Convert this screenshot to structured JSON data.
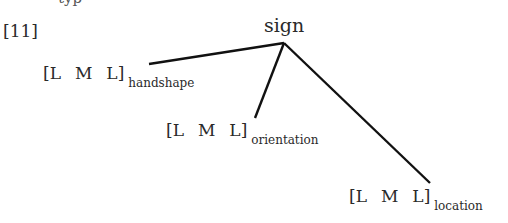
{
  "figure": {
    "example_number": "[11]",
    "root": "sign",
    "nodes": [
      {
        "segments": [
          "[L",
          "M",
          "L]"
        ],
        "subscript": "handshape"
      },
      {
        "segments": [
          "[L",
          "M",
          "L]"
        ],
        "subscript": "orientation"
      },
      {
        "segments": [
          "[L",
          "M",
          "L]"
        ],
        "subscript": "location"
      }
    ],
    "top_cut_text": "typ"
  }
}
